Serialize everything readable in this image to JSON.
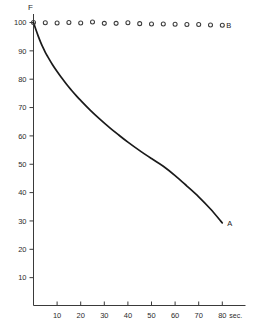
{
  "chart_data": {
    "type": "line",
    "title": "",
    "subtitle": "",
    "xlabel": "sec.",
    "ylabel": "F",
    "xlim": [
      0,
      80
    ],
    "ylim": [
      0,
      100
    ],
    "grid": false,
    "legend_position": "inline-right-of-series",
    "x_ticks": [
      10,
      20,
      30,
      40,
      50,
      60,
      70,
      80
    ],
    "x_tick_labels": [
      "10",
      "20",
      "30",
      "40",
      "50",
      "60",
      "70",
      "80"
    ],
    "y_ticks": [
      10,
      20,
      30,
      40,
      50,
      60,
      70,
      80,
      90,
      100
    ],
    "y_tick_labels": [
      "10",
      "20",
      "30",
      "40",
      "50",
      "60",
      "70",
      "80",
      "90",
      "100"
    ],
    "x_unit_suffix": "sec.",
    "series": [
      {
        "name": "A",
        "label": "A",
        "style": "solid-line",
        "color": "#1a1a1a",
        "x": [
          0,
          1,
          2,
          3,
          4,
          5,
          6,
          8,
          10,
          12,
          14,
          16,
          18,
          20,
          24,
          28,
          32,
          36,
          40,
          45,
          50,
          55,
          60,
          65,
          70,
          75,
          80
        ],
        "values": [
          100,
          97.5,
          95.2,
          93.1,
          91.2,
          89.5,
          88.0,
          85.2,
          82.7,
          80.4,
          78.2,
          76.2,
          74.3,
          72.5,
          69.1,
          66.0,
          63.1,
          60.4,
          57.8,
          54.8,
          52.0,
          49.3,
          46.0,
          42.3,
          38.5,
          34.2,
          29.3
        ]
      },
      {
        "name": "B",
        "label": "B",
        "style": "open-circle-markers",
        "color": "#3b3b3b",
        "x": [
          0,
          5,
          10,
          15,
          20,
          25,
          30,
          35,
          40,
          45,
          50,
          55,
          60,
          65,
          70,
          75,
          80
        ],
        "values": [
          100,
          99.9,
          99.8,
          100.0,
          99.8,
          100.2,
          99.7,
          99.7,
          99.9,
          99.6,
          99.5,
          99.5,
          99.4,
          99.3,
          99.3,
          99.1,
          99.0
        ]
      }
    ]
  }
}
